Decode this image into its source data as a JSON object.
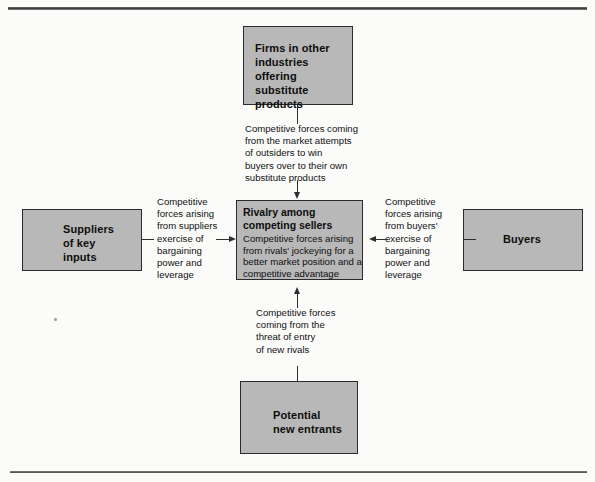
{
  "diagram": {
    "boxes": {
      "substitutes": {
        "label": "Firms in other\nindustries\noffering substitute\nproducts"
      },
      "suppliers": {
        "label": "Suppliers\nof key\ninputs"
      },
      "buyers": {
        "label": "Buyers"
      },
      "entrants": {
        "label": "Potential\nnew entrants"
      },
      "rivalry": {
        "title": "Rivalry among\ncompeting sellers",
        "body": "Competitive forces arising from rivals' jockeying for a better market position and a competitive advantage"
      }
    },
    "connectors": {
      "substitutes": {
        "text": "Competitive forces coming\nfrom the market attempts\nof outsiders to win\nbuyers over to their own\nsubstitute products"
      },
      "suppliers": {
        "text": "Competitive\nforces arising\nfrom suppliers\nexercise of\nbargaining\npower and\nleverage"
      },
      "buyers": {
        "text": "Competitive\nforces arising\nfrom buyers'\nexercise of\nbargaining\npower and\nleverage"
      },
      "entrants": {
        "text": "Competitive forces\ncoming from the\nthreat of entry\nof new rivals"
      }
    },
    "colors": {
      "box_fill": "#b8b8b8",
      "box_border": "#2b2b2b",
      "line": "#2e2e2e",
      "text": "#111111",
      "background": "#fbfbfa"
    }
  }
}
